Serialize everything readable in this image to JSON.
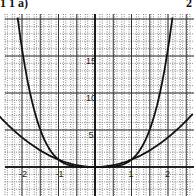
{
  "header": {
    "left": "1 1 a)",
    "right": "2"
  },
  "chart_data": {
    "type": "line",
    "title": "",
    "xlabel": "",
    "ylabel": "",
    "xlim": [
      -2.5,
      2.7
    ],
    "ylim": [
      -4,
      20
    ],
    "grid": true,
    "x_ticks": [
      "-2",
      "-1",
      "1",
      "2"
    ],
    "y_ticks": [
      "5",
      "10",
      "15"
    ],
    "series": [
      {
        "name": "y = x^4",
        "x": [
          -2.05,
          -2,
          -1.5,
          -1,
          -0.5,
          0,
          0.5,
          1,
          1.5,
          2,
          2.05
        ],
        "y": [
          17.7,
          16,
          5.06,
          1,
          0.06,
          0,
          0.06,
          1,
          5.06,
          16,
          17.7
        ]
      },
      {
        "name": "y = x^2",
        "x": [
          -2.5,
          -2,
          -1.5,
          -1,
          -0.5,
          0,
          0.5,
          1,
          1.5,
          2,
          2.5
        ],
        "y": [
          6.25,
          4,
          2.25,
          1,
          0.25,
          0,
          0.25,
          1,
          2.25,
          4,
          6.25
        ]
      }
    ]
  }
}
